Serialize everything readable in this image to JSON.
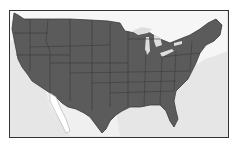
{
  "map": {
    "title": "",
    "region": "contiguous-united-states",
    "style": "grayscale-state-outline",
    "colors": {
      "land_us": "#5b5b5b",
      "state_borders": "#3a3a3a",
      "water_background": "#e6e6e6",
      "canada_mexico": "#f4f4f4",
      "great_lakes": "#dcdcdc",
      "frame": "#333333"
    }
  }
}
